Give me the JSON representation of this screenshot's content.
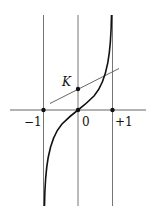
{
  "diagram": {
    "type": "function-graph",
    "labels": {
      "point_k": "K",
      "tick_minus_one": "−1",
      "tick_zero": "0",
      "tick_plus_one": "+1"
    },
    "axis": {
      "x_min_label": "−1",
      "x_max_label": "+1",
      "origin_label": "0"
    },
    "colors": {
      "stroke": "#111111",
      "thin": "#555555",
      "background": "#ffffff"
    }
  }
}
